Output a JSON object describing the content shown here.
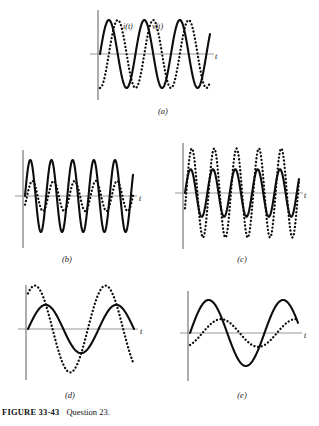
{
  "caption": {
    "figure_label": "FIGURE 33-43",
    "question": "Question 23."
  },
  "axis_label": "t",
  "curve_labels": {
    "current": "i(t)",
    "voltage": "v(t)"
  },
  "panels": [
    {
      "id": "a",
      "label": "(a)"
    },
    {
      "id": "b",
      "label": "(b)"
    },
    {
      "id": "c",
      "label": "(c)"
    },
    {
      "id": "d",
      "label": "(d)"
    },
    {
      "id": "e",
      "label": "(e)"
    }
  ],
  "colors": {
    "curve": "#0d0d0d",
    "axis": "#999999",
    "text": "#111111"
  },
  "chart_data": [
    {
      "id": "a",
      "type": "line",
      "title": "",
      "xlabel": "t",
      "ylabel": "",
      "grid": false,
      "legend": "inline-labels",
      "xlim": [
        0,
        3.2
      ],
      "ylim": [
        -1.25,
        1.25
      ],
      "annotations": [
        "i(t)",
        "v(t)"
      ],
      "series": [
        {
          "name": "i(t)",
          "style": "solid",
          "amplitude": 1.0,
          "cycles": 3.1,
          "phase_deg": 0
        },
        {
          "name": "v(t)",
          "style": "dotted",
          "amplitude": 1.0,
          "cycles": 3.1,
          "phase_deg": -90
        }
      ]
    },
    {
      "id": "b",
      "type": "line",
      "title": "",
      "xlabel": "t",
      "ylabel": "",
      "grid": false,
      "xlim": [
        0,
        5.2
      ],
      "ylim": [
        -1.25,
        1.25
      ],
      "series": [
        {
          "name": "solid",
          "style": "solid",
          "amplitude": 1.0,
          "cycles": 5.1,
          "phase_deg": 0
        },
        {
          "name": "dotted",
          "style": "dotted",
          "amplitude": 0.42,
          "cycles": 5.1,
          "phase_deg": -35
        }
      ]
    },
    {
      "id": "c",
      "type": "line",
      "title": "",
      "xlabel": "t",
      "ylabel": "",
      "grid": false,
      "xlim": [
        0,
        5.2
      ],
      "ylim": [
        -1.6,
        1.6
      ],
      "series": [
        {
          "name": "dotted",
          "style": "dotted",
          "amplitude": 1.35,
          "cycles": 5.1,
          "phase_deg": -20
        },
        {
          "name": "solid",
          "style": "solid",
          "amplitude": 0.72,
          "cycles": 5.1,
          "phase_deg": 0
        }
      ]
    },
    {
      "id": "d",
      "type": "line",
      "title": "",
      "xlabel": "t",
      "ylabel": "",
      "grid": false,
      "xlim": [
        0,
        1.6
      ],
      "ylim": [
        -1.6,
        1.6
      ],
      "series": [
        {
          "name": "dotted",
          "style": "dotted",
          "amplitude": 1.4,
          "cycles": 1.5,
          "phase_deg": 55
        },
        {
          "name": "solid",
          "style": "solid",
          "amplitude": 0.78,
          "cycles": 1.5,
          "phase_deg": 0
        }
      ]
    },
    {
      "id": "e",
      "type": "line",
      "title": "",
      "xlabel": "t",
      "ylabel": "",
      "grid": false,
      "xlim": [
        0,
        1.6
      ],
      "ylim": [
        -1.3,
        1.3
      ],
      "series": [
        {
          "name": "solid",
          "style": "solid",
          "amplitude": 1.0,
          "cycles": 1.45,
          "phase_deg": 0
        },
        {
          "name": "dotted",
          "style": "dotted",
          "amplitude": 0.42,
          "cycles": 1.45,
          "phase_deg": -60
        }
      ]
    }
  ]
}
